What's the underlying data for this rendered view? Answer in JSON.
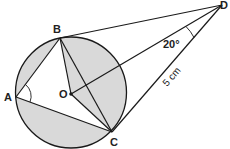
{
  "diagram": {
    "type": "circle-geometry",
    "colors": {
      "stroke": "#1a1a1a",
      "shade": "#d9d9d9",
      "background": "#ffffff"
    },
    "circle": {
      "center": "O",
      "cx": 71,
      "cy": 92.5,
      "r": 55.5
    },
    "points": {
      "A": {
        "label": "A",
        "x": 16,
        "y": 97
      },
      "B": {
        "label": "B",
        "x": 60,
        "y": 38
      },
      "C": {
        "label": "C",
        "x": 112,
        "y": 132
      },
      "D": {
        "label": "D",
        "x": 222,
        "y": 5
      },
      "O": {
        "label": "O",
        "x": 71,
        "y": 94
      }
    },
    "segments": [
      "A-B",
      "A-C",
      "B-C",
      "B-O",
      "O-C",
      "O-D",
      "B-D",
      "C-D"
    ],
    "tangents": [
      "DB",
      "DC"
    ],
    "angle_labels": {
      "BDO": "20°",
      "BAC": ""
    },
    "length_labels": {
      "DC": "5 cm"
    },
    "shaded_region": "Circle interior minus quadrilateral ABOC"
  }
}
